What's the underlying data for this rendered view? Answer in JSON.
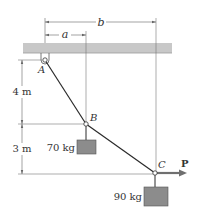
{
  "diagram": {
    "points": {
      "A": {
        "label": "A"
      },
      "B": {
        "label": "B"
      },
      "C": {
        "label": "C"
      }
    },
    "dimensions": {
      "a": "a",
      "b": "b",
      "h1": "4 m",
      "h2": "3 m"
    },
    "masses": {
      "B": "70 kg",
      "C": "90 kg"
    },
    "force": {
      "label": "P"
    },
    "colors": {
      "ceiling": "#c8c8c8",
      "cable": "#2a2a2a",
      "block": "#8c8c8c",
      "block_edge": "#555555",
      "arrow": "#6f6f6f",
      "dim_line": "#666666"
    }
  }
}
